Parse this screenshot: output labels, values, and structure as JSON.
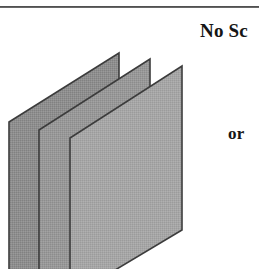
{
  "figure": {
    "domain": "Paper",
    "background_color": "#ffffff",
    "rule": {
      "name": "horizontal-rule",
      "color": "#3a3a3a",
      "y": 6,
      "thickness": 2
    },
    "labels": {
      "primary": "No Sc",
      "primary_note": "text clipped by the right edge of the crop",
      "secondary": "or"
    },
    "diagram": {
      "name": "stacked-planes-diagram",
      "description": "Three parallelogram sheets drawn in oblique perspective, offset down-left from one another",
      "sheet_count": 3,
      "sheets": [
        {
          "id": "back-sheet",
          "order": 1,
          "fill": "#8e8e8e",
          "stroke": "#3c3c3c",
          "points": "9,78 119,9 119,170 9,253"
        },
        {
          "id": "middle-sheet",
          "order": 2,
          "fill": "#989898",
          "stroke": "#3c3c3c",
          "points": "39,86 150,15 150,178 39,253"
        },
        {
          "id": "front-sheet",
          "order": 3,
          "fill": "#a6a6a6",
          "stroke": "#3c3c3c",
          "points": "70,94 182,22 182,186 70,253"
        }
      ],
      "texture": "dithered halftone gray"
    }
  }
}
